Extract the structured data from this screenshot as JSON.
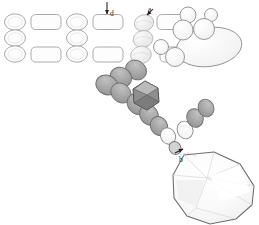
{
  "figure": {
    "kind": "technical-illustration",
    "background_color": "#ffffff",
    "outline_color": "#8c8c8c",
    "label_color": "#2b2b2b"
  },
  "labels": [
    {
      "id": "a",
      "text": "a",
      "x": 148,
      "y": 6,
      "leader": "arrow-down-left",
      "target": "top-row-round-bead"
    },
    {
      "id": "d",
      "text": "d",
      "x": 110,
      "y": 10,
      "leader": "arrow-down",
      "target": "bead-column-stack"
    },
    {
      "id": "b",
      "text": "b",
      "x": 179,
      "y": 156,
      "leader": "arrow-up-right",
      "target": "pendant-attachment-bead"
    }
  ],
  "grid": {
    "name": "bead-layout-grid",
    "row_y": [
      22,
      38,
      53
    ],
    "ellipse_rx": 10.5,
    "ellipse_ry": 8.0,
    "rect_w": 30,
    "rect_h": 15,
    "rows": [
      {
        "row": 1,
        "cells": [
          {
            "type": "ellipse",
            "cx": 15,
            "shade": "#fbfbfb"
          },
          {
            "type": "rect",
            "cx": 46,
            "shade": "#fcfcfc"
          },
          {
            "type": "ellipse",
            "cx": 77,
            "shade": "#fbfbfb"
          },
          {
            "type": "rect",
            "cx": 108,
            "shade": "#fcfcfc"
          },
          {
            "type": "ellipse",
            "cx": 139,
            "shade": "#f7f7f7"
          },
          {
            "type": "rect",
            "cx": 172,
            "shade": "#fcfcfc"
          }
        ]
      },
      {
        "row": 2,
        "cells": [
          {
            "type": "ellipse",
            "cx": 15,
            "shade": "#fbfbfb"
          },
          {
            "type": "ellipse",
            "cx": 77,
            "shade": "#fbfbfb"
          },
          {
            "type": "ellipse",
            "cx": 139,
            "shade": "#f7f7f7"
          }
        ]
      },
      {
        "row": 3,
        "cells": [
          {
            "type": "ellipse",
            "cx": 15,
            "shade": "#fbfbfb"
          },
          {
            "type": "rect",
            "cx": 46,
            "shade": "#fcfcfc"
          },
          {
            "type": "ellipse",
            "cx": 77,
            "shade": "#fbfbfb"
          },
          {
            "type": "rect",
            "cx": 108,
            "shade": "#fcfcfc"
          },
          {
            "type": "ellipse",
            "cx": 139,
            "shade": "#f7f7f7"
          },
          {
            "type": "rect",
            "cx": 175,
            "shade": "#fcfcfc"
          }
        ]
      }
    ]
  },
  "round_bead_cluster": {
    "name": "round-bead-cluster",
    "beads": [
      {
        "cx": 187,
        "cy": 16,
        "r": 8.5,
        "shade": "#fdfdfd"
      },
      {
        "cx": 183,
        "cy": 30,
        "r": 10.0,
        "shade": "#fafafa"
      },
      {
        "cx": 203,
        "cy": 29,
        "r": 10.5,
        "shade": "#fafafa"
      },
      {
        "cx": 211,
        "cy": 15,
        "r": 6.5,
        "shade": "#fdfdfd"
      },
      {
        "cx": 175,
        "cy": 57,
        "r": 9.5,
        "shade": "#fafafa"
      },
      {
        "cx": 161,
        "cy": 48,
        "r": 7.5,
        "shade": "#fcfcfc"
      }
    ]
  },
  "large_oval_bead": {
    "name": "large-oval-bead",
    "cx": 209,
    "cy": 47,
    "rx": 33,
    "ry": 19,
    "rotation": -8,
    "shade": "#fbfbfb"
  },
  "bead_strand": {
    "name": "diagonal-bead-strand",
    "note": "chain of flat gray disc beads running upper-right to lower-left then down to pendant",
    "beads": [
      {
        "cx": 145,
        "cy": 26,
        "rx": 9.5,
        "ry": 8.0,
        "rot": -18,
        "shade": "#f0f0f0"
      },
      {
        "cx": 143,
        "cy": 41,
        "rx": 10.0,
        "ry": 8.5,
        "rot": -15,
        "shade": "#ededed"
      },
      {
        "cx": 140,
        "cy": 56,
        "rx": 10.5,
        "ry": 9.0,
        "rot": -12,
        "shade": "#e2e2e2"
      },
      {
        "cx": 134,
        "cy": 70,
        "rx": 11.0,
        "ry": 9.5,
        "rot": 30,
        "shade": "#b3b3b3"
      },
      {
        "cx": 121,
        "cy": 76,
        "rx": 11.0,
        "ry": 9.5,
        "rot": 25,
        "shade": "#a8a8a8"
      },
      {
        "cx": 107,
        "cy": 84,
        "rx": 11.5,
        "ry": 9.5,
        "rot": 22,
        "shade": "#9f9f9f"
      },
      {
        "cx": 120,
        "cy": 92,
        "rx": 11.0,
        "ry": 9.0,
        "rot": 40,
        "shade": "#9a9a9a"
      },
      {
        "cx": 136,
        "cy": 103,
        "rx": 11.0,
        "ry": 9.5,
        "rot": 55,
        "shade": "#a5a5a5"
      },
      {
        "cx": 148,
        "cy": 114,
        "rx": 10.5,
        "ry": 9.0,
        "rot": 58,
        "shade": "#a0a0a0"
      },
      {
        "cx": 158,
        "cy": 125,
        "rx": 10.0,
        "ry": 8.5,
        "rot": 60,
        "shade": "#a8a8a8"
      },
      {
        "cx": 167,
        "cy": 135,
        "rx": 8.5,
        "ry": 7.5,
        "rot": 62,
        "shade": "#fafafa"
      },
      {
        "cx": 173,
        "cy": 146,
        "rx": 7.0,
        "ry": 6.0,
        "rot": 62,
        "shade": "#d8d8d8"
      },
      {
        "cx": 176,
        "cy": 153,
        "rx": 4.5,
        "ry": 4.0,
        "rot": 62,
        "shade": "#c8c8c8"
      },
      {
        "cx": 184,
        "cy": 130,
        "rx": 9.0,
        "ry": 8.0,
        "rot": 70,
        "shade": "#fbfbfb"
      },
      {
        "cx": 194,
        "cy": 118,
        "rx": 9.5,
        "ry": 8.5,
        "rot": 70,
        "shade": "#9d9d9d"
      },
      {
        "cx": 205,
        "cy": 108,
        "rx": 9.0,
        "ry": 8.0,
        "rot": 70,
        "shade": "#a3a3a3"
      }
    ]
  },
  "faceted_cube_bead": {
    "name": "faceted-hexagon-bead",
    "cx": 145,
    "cy": 95,
    "radius": 15,
    "shade": "#8a8a8a",
    "highlight": "#c9c9c9"
  },
  "pendant": {
    "name": "faceted-pear-pendant",
    "cx": 213,
    "cy": 189,
    "width": 86,
    "height": 74,
    "fill": "#fcfcfc",
    "outline": "#6e6e6e",
    "facet_shade_light": "#ffffff",
    "facet_shade_mid": "#f2f2f2",
    "facet_shade_dark": "#e6e6e6"
  }
}
